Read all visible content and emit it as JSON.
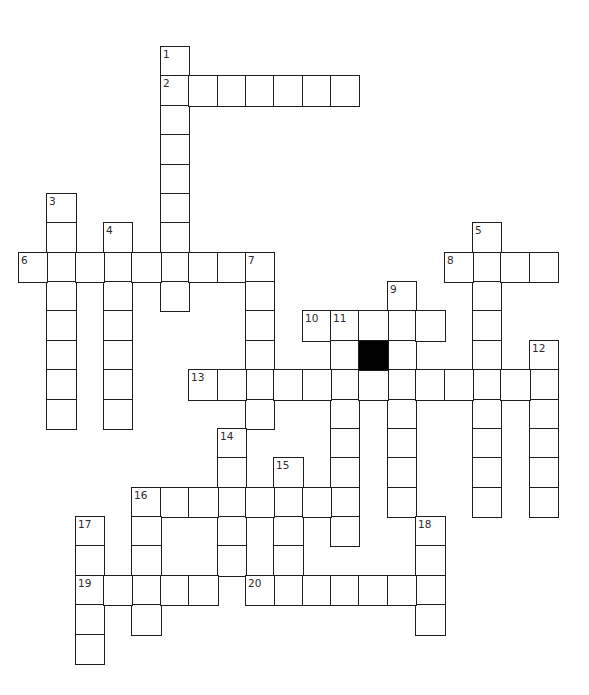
{
  "puzzle": {
    "type": "crossword",
    "grid": {
      "rows": 21,
      "cols": 19,
      "origin_x": 19,
      "origin_y": 47,
      "cell_w": 28.37,
      "cell_h": 29.38
    },
    "colors": {
      "line": "#1e1e1e",
      "cell_bg": "#ffffff",
      "block": "#000000",
      "number": "#2b2b2b"
    },
    "entries": [
      {
        "number": "1",
        "direction": "down",
        "row": 0,
        "col": 5,
        "length": 9
      },
      {
        "number": "2",
        "direction": "across",
        "row": 1,
        "col": 5,
        "length": 7
      },
      {
        "number": "3",
        "direction": "down",
        "row": 5,
        "col": 1,
        "length": 8
      },
      {
        "number": "4",
        "direction": "down",
        "row": 6,
        "col": 3,
        "length": 7
      },
      {
        "number": "5",
        "direction": "down",
        "row": 6,
        "col": 16,
        "length": 10
      },
      {
        "number": "6",
        "direction": "across",
        "row": 7,
        "col": 0,
        "length": 9
      },
      {
        "number": "7",
        "direction": "down",
        "row": 7,
        "col": 8,
        "length": 6
      },
      {
        "number": "8",
        "direction": "across",
        "row": 7,
        "col": 15,
        "length": 4
      },
      {
        "number": "9",
        "direction": "down",
        "row": 8,
        "col": 13,
        "length": 8
      },
      {
        "number": "10",
        "direction": "across",
        "row": 9,
        "col": 10,
        "length": 5
      },
      {
        "number": "11",
        "direction": "down",
        "row": 9,
        "col": 11,
        "length": 8
      },
      {
        "number": "12",
        "direction": "down",
        "row": 10,
        "col": 18,
        "length": 6
      },
      {
        "number": "13",
        "direction": "across",
        "row": 11,
        "col": 6,
        "length": 13
      },
      {
        "number": "14",
        "direction": "down",
        "row": 13,
        "col": 7,
        "length": 5
      },
      {
        "number": "15",
        "direction": "down",
        "row": 14,
        "col": 9,
        "length": 5
      },
      {
        "number": "16",
        "direction": "across",
        "row": 15,
        "col": 4,
        "length": 8
      },
      {
        "number": "16",
        "direction": "down",
        "row": 15,
        "col": 4,
        "length": 5
      },
      {
        "number": "17",
        "direction": "down",
        "row": 16,
        "col": 2,
        "length": 5
      },
      {
        "number": "18",
        "direction": "down",
        "row": 16,
        "col": 14,
        "length": 4
      },
      {
        "number": "19",
        "direction": "across",
        "row": 18,
        "col": 2,
        "length": 5
      },
      {
        "number": "20",
        "direction": "across",
        "row": 18,
        "col": 8,
        "length": 7
      }
    ],
    "black_cells": [
      {
        "row": 10,
        "col": 12
      }
    ],
    "letters": {}
  }
}
